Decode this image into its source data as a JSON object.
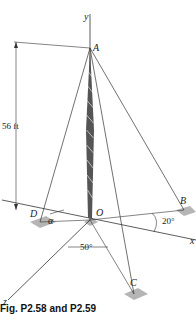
{
  "figure": {
    "caption": "Fig. P2.58 and P2.59",
    "points": {
      "A": "A",
      "B": "B",
      "C": "C",
      "D": "D",
      "O": "O"
    },
    "axes": {
      "x": "x",
      "y": "y",
      "z": "z"
    },
    "dimensions": {
      "height": "56 ft"
    },
    "angles": {
      "alpha": "α",
      "angle_B": "20°",
      "angle_C": "50°"
    },
    "colors": {
      "line": "#333333",
      "pad": "#b5b5b5",
      "background": "#ffffff"
    }
  }
}
